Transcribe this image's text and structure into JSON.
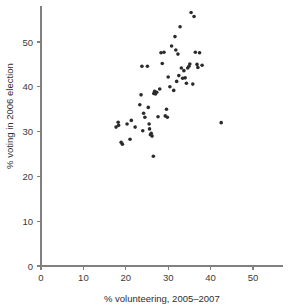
{
  "chart_data": {
    "type": "scatter",
    "title": "",
    "xlabel": "% volunteering, 2005–2007",
    "ylabel": "% voting in 2006 election",
    "xlim": [
      0,
      57
    ],
    "ylim": [
      0,
      58
    ],
    "xticks": [
      0,
      10,
      20,
      30,
      40,
      50
    ],
    "yticks": [
      0,
      10,
      20,
      30,
      40,
      50
    ],
    "xtick_labels": [
      "0",
      "10",
      "20",
      "30",
      "40",
      "50"
    ],
    "ytick_labels": [
      "0",
      "10",
      "20",
      "30",
      "40",
      "50"
    ],
    "grid": false,
    "legend": "none",
    "marker": "filled-circle",
    "marker_color": "#2b2b2b",
    "n_points": 62,
    "points": [
      [
        17.7,
        31.0
      ],
      [
        18.2,
        32.1
      ],
      [
        18.3,
        31.4
      ],
      [
        18.9,
        27.6
      ],
      [
        19.2,
        27.2
      ],
      [
        20.3,
        31.7
      ],
      [
        21.0,
        28.3
      ],
      [
        21.3,
        32.5
      ],
      [
        22.2,
        31.0
      ],
      [
        23.3,
        36.0
      ],
      [
        23.6,
        38.2
      ],
      [
        23.8,
        44.6
      ],
      [
        24.0,
        30.2
      ],
      [
        24.2,
        34.1
      ],
      [
        24.5,
        33.2
      ],
      [
        25.1,
        44.6
      ],
      [
        25.3,
        35.4
      ],
      [
        25.5,
        31.7
      ],
      [
        25.6,
        30.6
      ],
      [
        25.8,
        29.3
      ],
      [
        26.0,
        29.6
      ],
      [
        26.2,
        29.0
      ],
      [
        26.5,
        24.5
      ],
      [
        26.6,
        38.5
      ],
      [
        26.8,
        39.0
      ],
      [
        27.0,
        38.4
      ],
      [
        27.3,
        38.8
      ],
      [
        27.6,
        33.3
      ],
      [
        28.0,
        39.5
      ],
      [
        28.3,
        47.6
      ],
      [
        28.6,
        45.2
      ],
      [
        29.0,
        47.7
      ],
      [
        29.3,
        33.5
      ],
      [
        29.6,
        35.0
      ],
      [
        29.8,
        33.2
      ],
      [
        30.0,
        42.2
      ],
      [
        30.4,
        40.0
      ],
      [
        30.8,
        49.1
      ],
      [
        31.3,
        39.2
      ],
      [
        31.6,
        51.2
      ],
      [
        31.8,
        48.2
      ],
      [
        32.0,
        41.2
      ],
      [
        32.3,
        47.3
      ],
      [
        32.5,
        42.5
      ],
      [
        32.8,
        53.4
      ],
      [
        33.1,
        44.2
      ],
      [
        33.4,
        41.9
      ],
      [
        33.7,
        43.6
      ],
      [
        34.0,
        42.0
      ],
      [
        34.3,
        40.8
      ],
      [
        34.6,
        44.2
      ],
      [
        34.9,
        44.6
      ],
      [
        35.1,
        45.1
      ],
      [
        35.4,
        56.6
      ],
      [
        35.8,
        40.6
      ],
      [
        36.1,
        55.7
      ],
      [
        36.4,
        47.7
      ],
      [
        36.8,
        45.0
      ],
      [
        37.0,
        44.3
      ],
      [
        37.4,
        47.6
      ],
      [
        38.0,
        44.8
      ],
      [
        42.5,
        32.0
      ]
    ]
  },
  "geometry": {
    "origin_x_px": 41,
    "origin_y_px": 266,
    "x_unit_px": 4.24,
    "y_unit_px": 4.48
  }
}
